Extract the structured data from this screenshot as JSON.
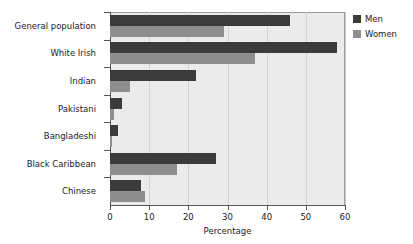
{
  "chart_data": {
    "type": "bar",
    "orientation": "horizontal",
    "title": "",
    "xlabel": "Percentage",
    "ylabel": "",
    "xlim": [
      0,
      60
    ],
    "xticks": [
      0,
      10,
      20,
      30,
      40,
      50,
      60
    ],
    "xtick_labels": [
      "0",
      "10",
      "20",
      "30",
      "40",
      "50",
      "60"
    ],
    "grid": "vertical",
    "legend_position": "right-top",
    "categories": [
      "General population",
      "White Irish",
      "Indian",
      "Pakistani",
      "Bangladeshi",
      "Black Caribbean",
      "Chinese"
    ],
    "series": [
      {
        "name": "Men",
        "color": "#3b3b3b",
        "values": [
          46,
          58,
          22,
          3,
          2,
          27,
          8
        ]
      },
      {
        "name": "Women",
        "color": "#8e8e8e",
        "values": [
          29,
          37,
          5,
          1,
          0.3,
          17,
          9
        ]
      }
    ]
  },
  "legend": {
    "items": [
      {
        "label": "Men"
      },
      {
        "label": "Women"
      }
    ]
  },
  "axis": {
    "x_title": "Percentage"
  },
  "colors": {
    "men": "#3b3b3b",
    "women": "#8e8e8e",
    "plot_background": "#ebebeb",
    "gridline": "#d2d2d2",
    "axis": "#555555",
    "text": "#1a1a1a",
    "page_background": "#ffffff"
  }
}
